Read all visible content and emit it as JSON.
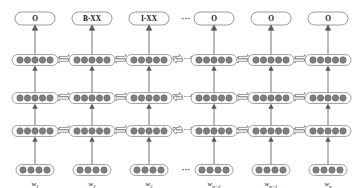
{
  "figure": {
    "type": "neural-network-architecture"
  },
  "colors": {
    "node_fill": "#7f7f7f",
    "node_stroke": "#636363",
    "cell_fill": "#fbfbfb",
    "cell_stroke": "#8d8d8d",
    "label_box_fill": "#ffffff",
    "label_box_stroke": "#808080",
    "arrow_fill": "#fdfdfd",
    "arrow_stroke": "#6b6b6b",
    "line_stroke": "#5a5a5a",
    "text": "#111111",
    "background": "#ffffff"
  },
  "output_labels": [
    {
      "text": "O"
    },
    {
      "text": "B-XX"
    },
    {
      "text": "I-XX"
    },
    {
      "text": "O"
    },
    {
      "text": "O"
    },
    {
      "text": "O"
    }
  ],
  "word_labels": [
    {
      "base": "w",
      "sub": "1"
    },
    {
      "base": "w",
      "sub": "2"
    },
    {
      "base": "w",
      "sub": "3"
    },
    {
      "base": "w",
      "sub": "n−2"
    },
    {
      "base": "w",
      "sub": "n−1"
    },
    {
      "base": "w",
      "sub": "n"
    }
  ],
  "ellipsis": {
    "glyph": "···",
    "label_row": "···",
    "word_row": "···"
  },
  "layers": [
    {
      "name": "bilstm-layer-3",
      "dots_per_cell": 5,
      "bidirectional": true
    },
    {
      "name": "bilstm-layer-2",
      "dots_per_cell": 5,
      "bidirectional": true
    },
    {
      "name": "bilstm-layer-1",
      "dots_per_cell": 5,
      "bidirectional": true
    },
    {
      "name": "embedding-layer",
      "dots_per_cell": 4,
      "bidirectional": false
    }
  ],
  "columns": 6,
  "geometry": {
    "column_x": [
      35,
      92,
      149,
      214,
      271,
      328
    ],
    "layer_y": [
      60,
      98,
      131,
      170
    ],
    "label_y": 19,
    "word_y": 184,
    "cell_width": 46,
    "cell_height": 11,
    "cell_width_embed": 38,
    "label_box_width": 40,
    "label_box_height": 12
  }
}
